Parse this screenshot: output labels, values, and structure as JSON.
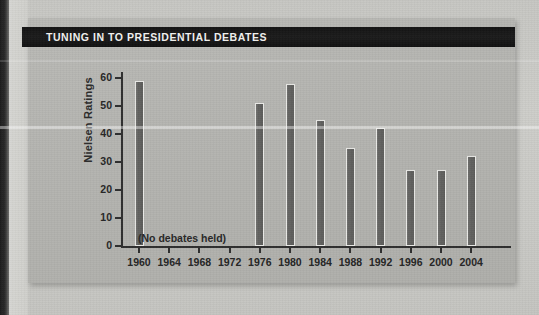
{
  "figure": {
    "title": "TUNING IN TO PRESIDENTIAL DEBATES"
  },
  "chart_data": {
    "type": "bar",
    "title": "TUNING IN TO PRESIDENTIAL DEBATES",
    "xlabel": "",
    "ylabel": "Nielsen Ratings",
    "categories": [
      "1960",
      "1964",
      "1968",
      "1972",
      "1976",
      "1980",
      "1984",
      "1988",
      "1992",
      "1996",
      "2000",
      "2004"
    ],
    "values": [
      59,
      null,
      null,
      null,
      51,
      58,
      45,
      35,
      42,
      27,
      27,
      32
    ],
    "ylim": [
      0,
      60
    ],
    "yticks": [
      0,
      10,
      20,
      30,
      40,
      50,
      60
    ],
    "ytick_labels": [
      "0",
      "10",
      "20",
      "30",
      "40",
      "50",
      "60"
    ],
    "grid": false,
    "legend": false,
    "annotations": [
      {
        "text": "(No debates held)",
        "covers_categories": [
          "1964",
          "1968",
          "1972"
        ]
      }
    ],
    "colors": {
      "bar_fill": "#63635f",
      "bar_outline": "#e9e9e6",
      "axis": "#2e2e2e",
      "panel_background": "#b4b4b0",
      "title_bar_background": "#131313",
      "title_text": "#f2f2f0"
    }
  }
}
